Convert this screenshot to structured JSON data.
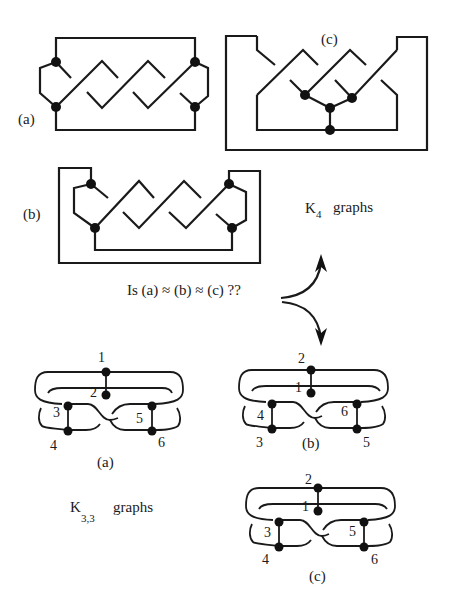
{
  "k4": {
    "group_label": "K",
    "group_subscript": "4",
    "group_suffix": "graphs",
    "a": {
      "label": "(a)"
    },
    "b": {
      "label": "(b)"
    },
    "c": {
      "label": "(c)"
    }
  },
  "question": {
    "text": "Is (a) ≈ (b) ≈ (c) ??"
  },
  "k33": {
    "group_label": "K",
    "group_subscript": "3,3",
    "group_suffix": "graphs",
    "a": {
      "label": "(a)",
      "vertices": [
        "1",
        "2",
        "3",
        "4",
        "5",
        "6"
      ]
    },
    "b": {
      "label": "(b)",
      "vertices": [
        "2",
        "1",
        "4",
        "3",
        "6",
        "5"
      ]
    },
    "c": {
      "label": "(c)",
      "vertices": [
        "2",
        "1",
        "3",
        "4",
        "5",
        "6"
      ]
    }
  },
  "colors": {
    "ink": "#1a1a1a",
    "background": "#ffffff"
  }
}
